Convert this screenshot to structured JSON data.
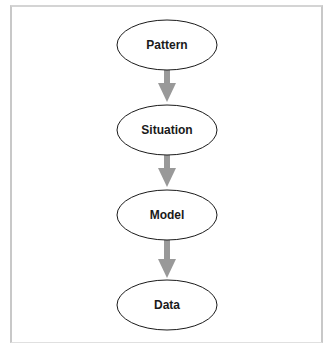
{
  "diagram": {
    "nodes": [
      {
        "id": "pattern",
        "label": "Pattern"
      },
      {
        "id": "situation",
        "label": "Situation"
      },
      {
        "id": "model",
        "label": "Model"
      },
      {
        "id": "data",
        "label": "Data"
      }
    ],
    "edges": [
      {
        "from": "pattern",
        "to": "situation"
      },
      {
        "from": "situation",
        "to": "model"
      },
      {
        "from": "model",
        "to": "data"
      }
    ],
    "colors": {
      "arrow": "#999999",
      "ellipse_stroke": "#1a1a1a",
      "frame": "#c8c8c8"
    }
  }
}
